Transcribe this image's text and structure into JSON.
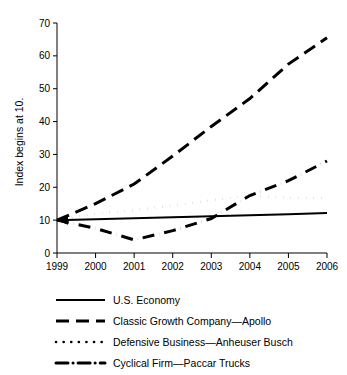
{
  "chart_data": {
    "type": "line",
    "title": "",
    "subtitle": "",
    "xlabel": "",
    "ylabel": "Index begins at 10.",
    "x": [
      1999,
      2000,
      2001,
      2002,
      2003,
      2004,
      2005,
      2006
    ],
    "x_tick_labels": [
      "1999",
      "2000",
      "2001",
      "2002",
      "2003",
      "2004",
      "2005",
      "2006"
    ],
    "y_tick_labels": [
      "0",
      "10",
      "20",
      "30",
      "40",
      "50",
      "60",
      "70"
    ],
    "y_ticks": [
      0,
      10,
      20,
      30,
      40,
      50,
      60,
      70
    ],
    "xlim": [
      1999,
      2006
    ],
    "ylim": [
      0,
      70
    ],
    "grid": false,
    "legend_position": "bottom",
    "series": [
      {
        "name": "U.S. Economy",
        "style": "solid",
        "color": "#000000",
        "values": [
          10,
          10.3,
          10.6,
          10.9,
          11.2,
          11.5,
          11.8,
          12.2
        ]
      },
      {
        "name": "Classic Growth Company—Apollo",
        "style": "dashed",
        "color": "#000000",
        "values": [
          10,
          15,
          21,
          29.5,
          38.5,
          47,
          57.5,
          65.5
        ]
      },
      {
        "name": "Defensive Business—Anheuser Busch",
        "style": "dotted",
        "color": "#000000",
        "values": [
          10,
          12,
          13,
          14.5,
          16,
          17.5,
          16.8,
          16.8
        ]
      },
      {
        "name": "Cyclical Firm—Paccar Trucks",
        "style": "dash-dot",
        "color": "#000000",
        "values": [
          10,
          7.5,
          4,
          6.8,
          10.5,
          17.5,
          22,
          28
        ]
      }
    ]
  },
  "axes": {
    "y_axis_title": "Index begins at 10."
  },
  "legend": {
    "items": [
      {
        "label": "U.S. Economy",
        "style": "solid"
      },
      {
        "label": "Classic Growth Company—Apollo",
        "style": "dashed"
      },
      {
        "label": "Defensive Business—Anheuser Busch",
        "style": "dotted"
      },
      {
        "label": "Cyclical Firm—Paccar Trucks",
        "style": "dash-dot"
      }
    ]
  }
}
